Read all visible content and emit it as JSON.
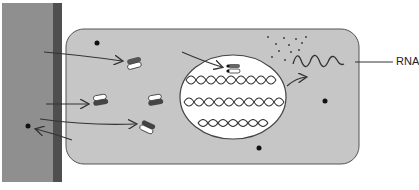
{
  "diagram": {
    "labels": {
      "rna": "RNA"
    },
    "colors": {
      "extracellular": "#8f8f8f",
      "membrane": "#4f4f4f",
      "cytoplasm": "#c6c6c6",
      "nucleus": "#ffffff",
      "stroke": "#333333"
    },
    "elements": [
      "extracellular-region",
      "cell-membrane",
      "cytoplasm",
      "nucleus",
      "dna-helices",
      "rna-strand",
      "ribosome-like-particles",
      "arrows"
    ]
  }
}
